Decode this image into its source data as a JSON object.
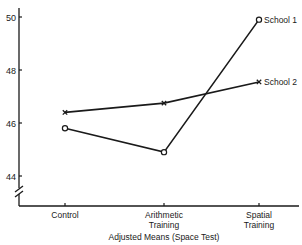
{
  "chart_data": {
    "type": "line",
    "title": "",
    "xlabel": "Adjusted Means (Space Test)",
    "ylabel": "",
    "categories": [
      "Control",
      "Arithmetic Training",
      "Spatial Training"
    ],
    "category_lines": [
      [
        "Control"
      ],
      [
        "Arithmetic",
        "Training"
      ],
      [
        "Spatial",
        "Training"
      ]
    ],
    "yticks": [
      44,
      46,
      48,
      50
    ],
    "ylim": [
      43,
      50.2
    ],
    "y_axis_break": true,
    "grid": false,
    "legend_position": "inline-right-end",
    "series": [
      {
        "name": "School 1",
        "marker": "circle",
        "values": [
          45.8,
          44.9,
          49.9
        ]
      },
      {
        "name": "School 2",
        "marker": "x",
        "values": [
          46.4,
          46.75,
          47.55
        ]
      }
    ]
  }
}
